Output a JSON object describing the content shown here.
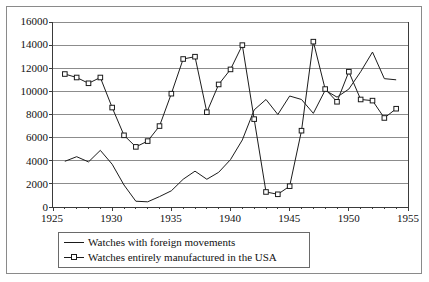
{
  "chart_data": {
    "type": "line",
    "title": "",
    "xlabel": "",
    "ylabel": "",
    "xlim": [
      1925,
      1955
    ],
    "ylim": [
      0,
      16000
    ],
    "xticks": [
      1925,
      1930,
      1935,
      1940,
      1945,
      1950,
      1955
    ],
    "yticks": [
      0,
      2000,
      4000,
      6000,
      8000,
      10000,
      12000,
      14000,
      16000
    ],
    "grid": "horizontal",
    "legend_position": "below-axes",
    "series": [
      {
        "name": "Watches with foreign movements",
        "marker": "none",
        "color": "#1a1a1a",
        "x": [
          1926,
          1927,
          1928,
          1929,
          1930,
          1931,
          1932,
          1933,
          1934,
          1935,
          1936,
          1937,
          1938,
          1939,
          1940,
          1941,
          1942,
          1943,
          1944,
          1945,
          1946,
          1947,
          1948,
          1949,
          1950,
          1951,
          1952,
          1953,
          1954
        ],
        "values": [
          3950,
          4350,
          3900,
          4900,
          3700,
          1900,
          500,
          450,
          900,
          1400,
          2400,
          3100,
          2400,
          3000,
          4100,
          5800,
          8400,
          9300,
          8000,
          9600,
          9300,
          8100,
          10100,
          9500,
          10200,
          11700,
          13400,
          11100,
          11000
        ]
      },
      {
        "name": "Watches entirely manufactured in the USA",
        "marker": "square-open",
        "color": "#1a1a1a",
        "x": [
          1926,
          1927,
          1928,
          1929,
          1930,
          1931,
          1932,
          1933,
          1934,
          1935,
          1936,
          1937,
          1938,
          1939,
          1940,
          1941,
          1942,
          1943,
          1944,
          1945,
          1946,
          1947,
          1948,
          1949,
          1950,
          1951,
          1952,
          1953,
          1954
        ],
        "values": [
          11500,
          11200,
          10700,
          11200,
          8600,
          6200,
          5200,
          5700,
          7000,
          9800,
          12800,
          13000,
          8200,
          10600,
          11900,
          14000,
          7600,
          1300,
          1100,
          1800,
          6600,
          14300,
          10200,
          9100,
          11700,
          9300,
          9200,
          7700,
          8500
        ]
      }
    ]
  },
  "axes": {
    "y_tick_labels": [
      "16000",
      "14000",
      "12000",
      "10000",
      "8000",
      "6000",
      "4000",
      "2000",
      "0"
    ],
    "x_tick_labels": [
      "1925",
      "1930",
      "1935",
      "1940",
      "1945",
      "1950",
      "1955"
    ]
  },
  "legend": {
    "items": [
      {
        "label": "Watches with foreign movements",
        "marker": "none"
      },
      {
        "label": "Watches entirely manufactured in the USA",
        "marker": "square-open"
      }
    ]
  }
}
